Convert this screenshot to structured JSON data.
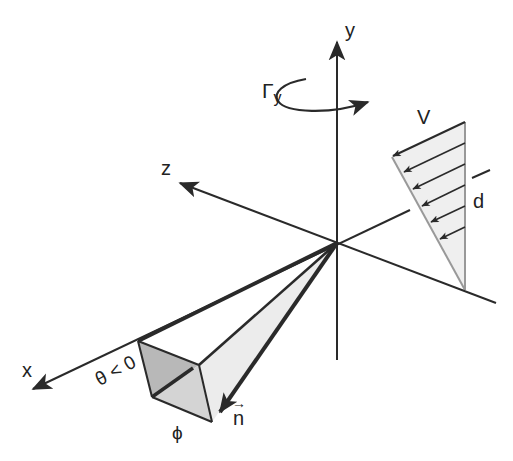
{
  "diagram": {
    "labels": {
      "y_axis": "y",
      "z_axis": "z",
      "x_axis": "x",
      "rotation": "Γ",
      "rotation_sub": "y",
      "velocity": "V",
      "depth": "d",
      "theta": "θ < 0",
      "phi": "ϕ",
      "normal": "n"
    },
    "colors": {
      "line": "#2a2a2a",
      "face_dark": "#b8b8b8",
      "face_mid": "#d4d4d4",
      "face_light": "#ececec",
      "profile_fill": "#efefef",
      "profile_edge": "#999999"
    },
    "velocity_profile_arrows": 6
  }
}
